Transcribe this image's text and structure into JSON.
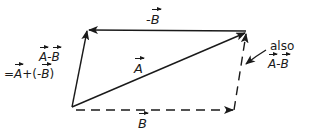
{
  "figure": {
    "stroke_color": "#1a1a1a",
    "background": "#ffffff"
  },
  "points": {
    "origin": [
      72,
      107
    ],
    "top_left": [
      88,
      30
    ],
    "top_right": [
      246,
      32
    ],
    "bottom_right": [
      234,
      110
    ]
  },
  "vectors": [
    {
      "id": "A",
      "from": "origin",
      "to": "top_right",
      "style": "solid",
      "label": "A"
    },
    {
      "id": "neg-B",
      "from": "top_right",
      "to": "top_left",
      "style": "solid",
      "label": "-B"
    },
    {
      "id": "A-minus-B-left",
      "from": "origin",
      "to": "top_left",
      "style": "solid"
    },
    {
      "id": "B",
      "from": "origin",
      "to": "bottom_right",
      "style": "dashed",
      "label": "B"
    },
    {
      "id": "A-minus-B-right",
      "from": "bottom_right",
      "to": "top_right",
      "style": "dashed"
    }
  ],
  "labels": {
    "neg_b": {
      "sign": "-",
      "letter": "B"
    },
    "a": {
      "letter": "A"
    },
    "b": {
      "letter": "B"
    },
    "left_difference": {
      "a": "A",
      "minus": "-",
      "b": "B"
    },
    "left_equation": {
      "eq": "=",
      "a": "A",
      "plus": "+(-",
      "b": "B",
      "close": ")"
    },
    "also": {
      "word": "also",
      "a": "A",
      "minus": "-",
      "b": "B"
    }
  }
}
